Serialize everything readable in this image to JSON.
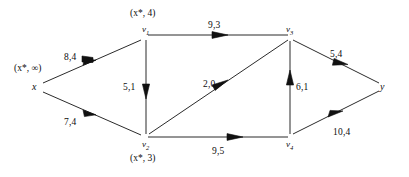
{
  "figure": {
    "type": "flow-network-diagram",
    "background": "#ffffff",
    "stroke_color": "#2b2b2b"
  },
  "nodes": [
    {
      "id": "x",
      "label": "x",
      "sub": "",
      "cx": 37,
      "cy": 87,
      "tag": "(x*, ∞)"
    },
    {
      "id": "v1",
      "label": "v",
      "sub": "1",
      "cx": 146,
      "cy": 38,
      "tag": "(x*, 4)"
    },
    {
      "id": "v2",
      "label": "v",
      "sub": "2",
      "cx": 146,
      "cy": 137,
      "tag": "(x*, 3)"
    },
    {
      "id": "v3",
      "label": "v",
      "sub": "3",
      "cx": 290,
      "cy": 38,
      "tag": ""
    },
    {
      "id": "v4",
      "label": "v",
      "sub": "4",
      "cx": 290,
      "cy": 137,
      "tag": ""
    },
    {
      "id": "y",
      "label": "y",
      "sub": "",
      "cx": 382,
      "cy": 87,
      "tag": ""
    }
  ],
  "edges": [
    {
      "from": "x",
      "to": "v1",
      "weight": "8,4",
      "label_x": 64,
      "label_y": 52
    },
    {
      "from": "x",
      "to": "v2",
      "weight": "7,4",
      "label_x": 64,
      "label_y": 117
    },
    {
      "from": "v1",
      "to": "v3",
      "weight": "9,3",
      "label_x": 208,
      "label_y": 20
    },
    {
      "from": "v1",
      "to": "v2",
      "weight": "5,1",
      "label_x": 123,
      "label_y": 82
    },
    {
      "from": "v2",
      "to": "v3",
      "weight": "2,0",
      "label_x": 203,
      "label_y": 79
    },
    {
      "from": "v2",
      "to": "v4",
      "weight": "9,5",
      "label_x": 212,
      "label_y": 146
    },
    {
      "from": "v4",
      "to": "v3",
      "weight": "6,1",
      "label_x": 296,
      "label_y": 82
    },
    {
      "from": "v3",
      "to": "y",
      "weight": "5,4",
      "label_x": 330,
      "label_y": 49
    },
    {
      "from": "v4",
      "to": "y",
      "weight": "10,4",
      "label_x": 333,
      "label_y": 127
    }
  ],
  "node_labels": {
    "x_tag": "(x*, ∞)",
    "v1_tag": "(x*, 4)",
    "v2_tag": "(x*, 3)"
  }
}
